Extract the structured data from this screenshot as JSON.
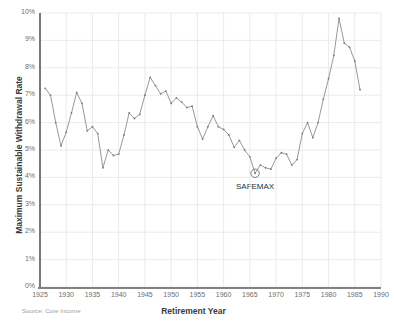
{
  "chart_data": {
    "type": "line",
    "title": "",
    "xlabel": "Retirement Year",
    "ylabel": "Maximum Sustainable Withdrawal Rate",
    "source": "Source: Core Income",
    "xlim": [
      1925,
      1990
    ],
    "ylim": [
      0,
      10
    ],
    "grid": true,
    "legend": false,
    "y_tick_labels": [
      "0%",
      "1%",
      "2%",
      "3%",
      "4%",
      "5%",
      "6%",
      "7%",
      "8%",
      "9%",
      "10%"
    ],
    "y_tick_values": [
      0,
      1,
      2,
      3,
      4,
      5,
      6,
      7,
      8,
      9,
      10
    ],
    "x_tick_labels": [
      "1925",
      "1930",
      "1935",
      "1940",
      "1945",
      "1950",
      "1955",
      "1960",
      "1965",
      "1970",
      "1975",
      "1980",
      "1985",
      "1990"
    ],
    "x_tick_values": [
      1925,
      1930,
      1935,
      1940,
      1945,
      1950,
      1955,
      1960,
      1965,
      1970,
      1975,
      1980,
      1985,
      1990
    ],
    "series": [
      {
        "name": "Maximum Sustainable Withdrawal Rate",
        "color": "#8c8c8c",
        "marker": "point",
        "x": [
          1926,
          1927,
          1928,
          1929,
          1930,
          1931,
          1932,
          1933,
          1934,
          1935,
          1936,
          1937,
          1938,
          1939,
          1940,
          1941,
          1942,
          1943,
          1944,
          1945,
          1946,
          1947,
          1948,
          1949,
          1950,
          1951,
          1952,
          1953,
          1954,
          1955,
          1956,
          1957,
          1958,
          1959,
          1960,
          1961,
          1962,
          1963,
          1964,
          1965,
          1966,
          1967,
          1968,
          1969,
          1970,
          1971,
          1972,
          1973,
          1974,
          1975,
          1976,
          1977,
          1978,
          1979,
          1980,
          1981,
          1982,
          1983,
          1984,
          1985,
          1986
        ],
        "y": [
          7.25,
          7.0,
          6.0,
          5.15,
          5.65,
          6.35,
          7.1,
          6.7,
          5.7,
          5.85,
          5.6,
          4.35,
          5.0,
          4.8,
          4.85,
          5.55,
          6.35,
          6.15,
          6.3,
          7.0,
          7.65,
          7.35,
          7.05,
          7.15,
          6.7,
          6.9,
          6.75,
          6.55,
          6.6,
          5.85,
          5.4,
          5.85,
          6.25,
          5.85,
          5.75,
          5.55,
          5.1,
          5.35,
          5.0,
          4.75,
          4.15,
          4.45,
          4.35,
          4.3,
          4.7,
          4.9,
          4.85,
          4.45,
          4.65,
          5.6,
          6.0,
          5.45,
          6.0,
          6.85,
          7.6,
          8.45,
          9.8,
          8.9,
          8.75,
          8.25,
          7.2
        ],
        "annotations": [
          {
            "label": "SAFEMAX",
            "x": 1966,
            "y": 4.15,
            "marker": "circle"
          }
        ]
      }
    ]
  }
}
